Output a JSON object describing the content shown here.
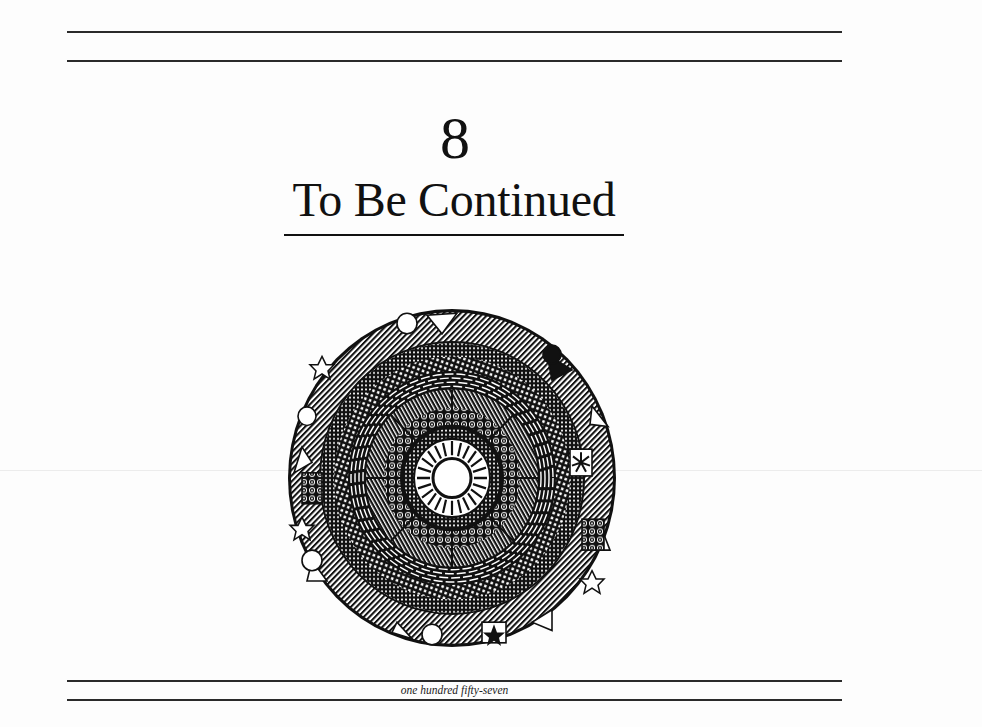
{
  "page": {
    "chapter_number": "8",
    "chapter_title": "To Be Continued",
    "folio": "one hundred fifty-seven"
  },
  "illustration": {
    "type": "circular-mandala-ink-drawing",
    "icon": "mandala-icon",
    "colors": {
      "ink": "#111111",
      "paper": "#fdfdfd"
    }
  }
}
